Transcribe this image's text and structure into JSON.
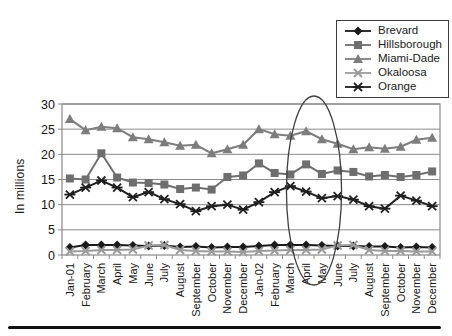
{
  "chart_data": {
    "type": "line",
    "title": "",
    "xlabel": "",
    "ylabel": "In millions",
    "ylim": [
      0,
      30
    ],
    "ytick_step": 5,
    "grid": "horizontal",
    "legend_position": "top-right",
    "categories": [
      "Jan-01",
      "February",
      "March",
      "April",
      "May",
      "June",
      "July",
      "August",
      "September",
      "October",
      "November",
      "December",
      "Jan-02",
      "February",
      "March",
      "April",
      "May",
      "June",
      "July",
      "August",
      "September",
      "October",
      "November",
      "December"
    ],
    "series": [
      {
        "name": "Brevard",
        "marker": "diamond",
        "color": "#1a1a1a",
        "values": [
          1.5,
          2.0,
          2.0,
          2.0,
          1.9,
          1.8,
          1.9,
          1.6,
          1.7,
          1.5,
          1.6,
          1.6,
          1.8,
          2.0,
          2.0,
          2.0,
          1.9,
          1.8,
          1.8,
          1.7,
          1.7,
          1.5,
          1.6,
          1.5
        ]
      },
      {
        "name": "Hillsborough",
        "marker": "square",
        "color": "#6e6e6e",
        "values": [
          15.2,
          15.0,
          20.2,
          15.4,
          14.4,
          14.3,
          14.0,
          13.1,
          13.4,
          13.0,
          15.5,
          15.8,
          18.2,
          16.3,
          16.0,
          18.0,
          16.1,
          16.8,
          16.5,
          15.6,
          15.9,
          15.5,
          15.9,
          16.6
        ]
      },
      {
        "name": "Miami-Dade",
        "marker": "triangle",
        "color": "#7d7d7d",
        "values": [
          27.0,
          24.8,
          25.5,
          25.2,
          23.4,
          23.0,
          22.4,
          21.7,
          21.9,
          20.2,
          21.0,
          21.9,
          25.0,
          24.0,
          23.7,
          24.6,
          23.0,
          22.1,
          21.0,
          21.4,
          21.1,
          21.5,
          22.9,
          23.3
        ]
      },
      {
        "name": "Okaloosa",
        "marker": "x",
        "color": "#9b9b9b",
        "values": [
          0.7,
          0.8,
          1.0,
          1.0,
          1.1,
          1.9,
          2.0,
          1.0,
          0.8,
          0.7,
          0.7,
          0.6,
          0.8,
          0.9,
          1.0,
          1.0,
          1.1,
          1.9,
          2.0,
          1.0,
          0.8,
          0.8,
          0.7,
          0.7
        ]
      },
      {
        "name": "Orange",
        "marker": "asterisk",
        "color": "#1f1f1f",
        "values": [
          12.0,
          13.4,
          14.8,
          13.4,
          11.5,
          12.5,
          11.1,
          10.1,
          8.7,
          9.7,
          10.0,
          9.0,
          10.5,
          12.5,
          13.7,
          12.6,
          11.3,
          11.7,
          11.0,
          9.7,
          9.2,
          11.8,
          10.8,
          9.7
        ]
      }
    ],
    "annotation": {
      "shape": "ellipse",
      "circled_categories": [
        "April",
        "May"
      ],
      "circled_year": "2002",
      "from_index": 15,
      "to_index": 16,
      "color": "#3f3f3f"
    },
    "axis_color": "#8a8a8a",
    "text_color": "#151515"
  }
}
